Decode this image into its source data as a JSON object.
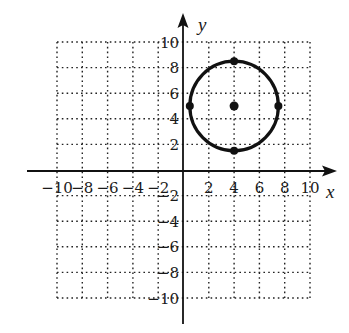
{
  "chart_data": {
    "type": "scatter",
    "title": "",
    "xlabel": "x",
    "ylabel": "y",
    "xlim": [
      -10,
      10
    ],
    "ylim": [
      -10,
      10
    ],
    "grid": true,
    "grid_style": "dotted",
    "grid_step": 2,
    "x_tick_labels": [
      "-10",
      "-8",
      "-6",
      "-4",
      "-2",
      "2",
      "4",
      "6",
      "8",
      "10"
    ],
    "y_tick_labels": [
      "10",
      "8",
      "6",
      "4",
      "2",
      "-2",
      "-4",
      "-6",
      "-8",
      "-10"
    ],
    "x_ticks": [
      -10,
      -8,
      -6,
      -4,
      -2,
      2,
      4,
      6,
      8,
      10
    ],
    "y_ticks": [
      10,
      8,
      6,
      4,
      2,
      -2,
      -4,
      -6,
      -8,
      -10
    ],
    "series": [
      {
        "name": "circle",
        "kind": "circle",
        "center": [
          4,
          5
        ],
        "radius": 3.5
      },
      {
        "name": "center",
        "kind": "point",
        "points": [
          [
            4,
            5
          ]
        ]
      },
      {
        "name": "circle-points",
        "kind": "points",
        "points": [
          [
            4,
            8.5
          ],
          [
            4,
            1.5
          ],
          [
            0.5,
            5
          ],
          [
            7.5,
            5
          ]
        ]
      }
    ]
  },
  "labels": {
    "x_axis": "x",
    "y_axis": "y"
  },
  "colors": {
    "ink": "#111111",
    "background": "#ffffff"
  }
}
